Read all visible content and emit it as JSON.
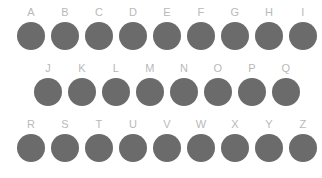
{
  "canvas": {
    "width": 322,
    "height": 178,
    "background_color": "#ffffff"
  },
  "style": {
    "dot_color": "#6b6b6b",
    "label_color": "#b9b9b9",
    "dot_diameter_px": 28
  },
  "rows": [
    {
      "name": "row-1",
      "items": [
        {
          "label": "A"
        },
        {
          "label": "B"
        },
        {
          "label": "C"
        },
        {
          "label": "D"
        },
        {
          "label": "E"
        },
        {
          "label": "F"
        },
        {
          "label": "G"
        },
        {
          "label": "H"
        },
        {
          "label": "I"
        }
      ]
    },
    {
      "name": "row-2",
      "items": [
        {
          "label": "J"
        },
        {
          "label": "K"
        },
        {
          "label": "L"
        },
        {
          "label": "M"
        },
        {
          "label": "N"
        },
        {
          "label": "O"
        },
        {
          "label": "P"
        },
        {
          "label": "Q"
        }
      ]
    },
    {
      "name": "row-3",
      "items": [
        {
          "label": "R"
        },
        {
          "label": "S"
        },
        {
          "label": "T"
        },
        {
          "label": "U"
        },
        {
          "label": "V"
        },
        {
          "label": "W"
        },
        {
          "label": "X"
        },
        {
          "label": "Y"
        },
        {
          "label": "Z"
        }
      ]
    }
  ]
}
